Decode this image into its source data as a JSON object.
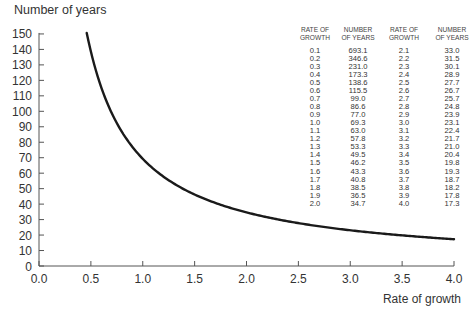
{
  "chart_data": {
    "type": "line",
    "title": "",
    "xlabel": "Rate of growth",
    "ylabel": "Number of years",
    "xlim": [
      0.0,
      4.0
    ],
    "ylim": [
      0,
      150
    ],
    "xticks": [
      "0.0",
      "0.5",
      "1.0",
      "1.5",
      "2.0",
      "2.5",
      "3.0",
      "3.5",
      "4.0"
    ],
    "yticks": [
      "0",
      "10",
      "20",
      "30",
      "40",
      "50",
      "60",
      "70",
      "80",
      "90",
      "100",
      "110",
      "120",
      "130",
      "140",
      "150"
    ],
    "grid": false,
    "legend": null,
    "series": [
      {
        "name": "Doubling time",
        "x": [
          0.46,
          0.5,
          0.6,
          0.7,
          0.8,
          0.9,
          1.0,
          1.1,
          1.2,
          1.3,
          1.4,
          1.5,
          1.6,
          1.7,
          1.8,
          1.9,
          2.0,
          2.1,
          2.2,
          2.3,
          2.4,
          2.5,
          2.6,
          2.7,
          2.8,
          2.9,
          3.0,
          3.1,
          3.2,
          3.3,
          3.4,
          3.5,
          3.6,
          3.7,
          3.8,
          3.9,
          4.0
        ],
        "y": [
          150.0,
          138.6,
          115.5,
          99.0,
          86.6,
          77.0,
          69.3,
          63.0,
          57.8,
          53.3,
          49.5,
          46.2,
          43.3,
          40.8,
          38.5,
          36.5,
          34.7,
          33.0,
          31.5,
          30.1,
          28.9,
          27.7,
          26.7,
          25.7,
          24.8,
          23.9,
          23.1,
          22.4,
          21.7,
          21.0,
          20.4,
          19.8,
          19.3,
          18.7,
          18.2,
          17.8,
          17.3
        ]
      }
    ],
    "table": {
      "headers": [
        "RATE OF\nGROWTH",
        "NUMBER\nOF YEARS",
        "RATE OF\nGROWTH",
        "NUMBER\nOF YEARS"
      ],
      "rows": [
        [
          "0.1",
          "693.1",
          "2.1",
          "33.0"
        ],
        [
          "0.2",
          "346.6",
          "2.2",
          "31.5"
        ],
        [
          "0.3",
          "231.0",
          "2.3",
          "30.1"
        ],
        [
          "0.4",
          "173.3",
          "2.4",
          "28.9"
        ],
        [
          "0.5",
          "138.6",
          "2.5",
          "27.7"
        ],
        [
          "0.6",
          "115.5",
          "2.6",
          "26.7"
        ],
        [
          "0.7",
          "99.0",
          "2.7",
          "25.7"
        ],
        [
          "0.8",
          "86.6",
          "2.8",
          "24.8"
        ],
        [
          "0.9",
          "77.0",
          "2.9",
          "23.9"
        ],
        [
          "1.0",
          "69.3",
          "3.0",
          "23.1"
        ],
        [
          "1.1",
          "63.0",
          "3.1",
          "22.4"
        ],
        [
          "1.2",
          "57.8",
          "3.2",
          "21.7"
        ],
        [
          "1.3",
          "53.3",
          "3.3",
          "21.0"
        ],
        [
          "1.4",
          "49.5",
          "3.4",
          "20.4"
        ],
        [
          "1.5",
          "46.2",
          "3.5",
          "19.8"
        ],
        [
          "1.6",
          "43.3",
          "3.6",
          "19.3"
        ],
        [
          "1.7",
          "40.8",
          "3.7",
          "18.7"
        ],
        [
          "1.8",
          "38.5",
          "3.8",
          "18.2"
        ],
        [
          "1.9",
          "36.5",
          "3.9",
          "17.8"
        ],
        [
          "2.0",
          "34.7",
          "4.0",
          "17.3"
        ]
      ]
    }
  },
  "layout": {
    "x0_px": 39,
    "x_px_per_unit": 103.75,
    "y0_px": 266,
    "y_px_per_unit": 1.547,
    "line_color": "#1a1a1a",
    "axis_color": "#555555"
  }
}
